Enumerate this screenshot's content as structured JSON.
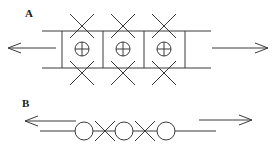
{
  "figure": {
    "width": 275,
    "height": 148,
    "background_color": "#ffffff",
    "stroke_color": "#3a3a3a",
    "stroke_width": 1,
    "panels": [
      {
        "id": "A",
        "label": "A",
        "label_x": 25,
        "label_y": 8,
        "description": "ladder / two-rail track with three cells, each cell containing a circled-plus symbol, with X symbols on the upper and lower rails",
        "rails": {
          "x_start": 42,
          "x_end": 211,
          "y_top": 31,
          "y_bottom": 68
        },
        "rungs_x": [
          62,
          103,
          144,
          185
        ],
        "cells": [
          {
            "center_x": 82,
            "center_y": 49,
            "symbol": "circled-plus",
            "radius": 7
          },
          {
            "center_x": 123,
            "center_y": 49,
            "symbol": "circled-plus",
            "radius": 7
          },
          {
            "center_x": 164,
            "center_y": 49,
            "symbol": "circled-plus",
            "radius": 7
          }
        ],
        "x_marks_top": [
          {
            "center_x": 82,
            "center_y": 26,
            "arm": 12
          },
          {
            "center_x": 123,
            "center_y": 26,
            "arm": 12
          },
          {
            "center_x": 164,
            "center_y": 26,
            "arm": 12
          }
        ],
        "x_marks_bottom": [
          {
            "center_x": 82,
            "center_y": 73,
            "arm": 12
          },
          {
            "center_x": 123,
            "center_y": 73,
            "arm": 12
          },
          {
            "center_x": 164,
            "center_y": 73,
            "arm": 12
          }
        ],
        "arrows": [
          {
            "name": "left-arrow",
            "direction": "left",
            "tail_x": 56,
            "tip_x": 8,
            "y": 48,
            "head_length": 13,
            "head_half_height": 5
          },
          {
            "name": "right-arrow",
            "direction": "right",
            "tail_x": 212,
            "tip_x": 268,
            "y": 48,
            "head_length": 13,
            "head_half_height": 5
          }
        ]
      },
      {
        "id": "B",
        "label": "B",
        "label_x": 22,
        "label_y": 98,
        "description": "single horizontal line with three open circles alternating with two X symbols",
        "line": {
          "x_start": 40,
          "x_end": 216,
          "y": 131
        },
        "circles": [
          {
            "center_x": 84,
            "center_y": 131,
            "radius": 9
          },
          {
            "center_x": 124,
            "center_y": 131,
            "radius": 9
          },
          {
            "center_x": 166,
            "center_y": 131,
            "radius": 9
          }
        ],
        "x_marks": [
          {
            "center_x": 105,
            "center_y": 131,
            "arm": 10
          },
          {
            "center_x": 145,
            "center_y": 131,
            "arm": 10
          }
        ],
        "arrows": [
          {
            "name": "left-arrow",
            "direction": "left",
            "tail_x": 76,
            "tip_x": 25,
            "y": 121,
            "head_length": 13,
            "head_half_height": 5
          },
          {
            "name": "right-arrow",
            "direction": "right",
            "tail_x": 199,
            "tip_x": 252,
            "y": 120,
            "head_length": 13,
            "head_half_height": 5
          }
        ]
      }
    ]
  }
}
